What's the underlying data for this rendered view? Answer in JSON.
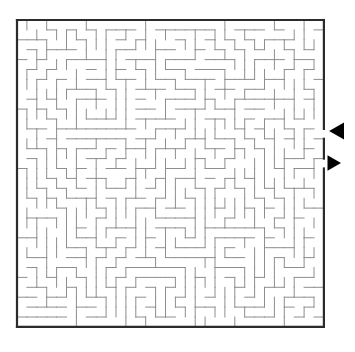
{
  "page": {
    "width": 355,
    "height": 352,
    "background_color": "#ffffff"
  },
  "maze": {
    "name": "rectangular-perfect-maze",
    "cols": 31,
    "rows": 31,
    "cell_size": 9.9,
    "origin_x": 17,
    "origin_y": 20,
    "border_color": "#2b2b2b",
    "border_width": 2.2,
    "wall_color": "#8e8e8e",
    "wall_width": 1.0,
    "background_color": "#ffffff",
    "entrance": {
      "label": "entrance",
      "side": "right",
      "row": 11,
      "arrow_direction": "left",
      "arrow_color": "#000000",
      "arrow_x": 333,
      "arrow_y": 131,
      "arrow_size": 11
    },
    "exit": {
      "label": "exit",
      "side": "right",
      "row": 14,
      "arrow_direction": "right",
      "arrow_color": "#000000",
      "arrow_x": 331,
      "arrow_y": 163,
      "arrow_size": 10
    },
    "seed": 20240817,
    "open_right_rows": [
      11,
      14
    ]
  }
}
